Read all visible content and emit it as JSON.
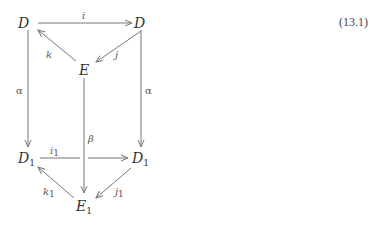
{
  "equation_number": "(13.1)",
  "nodes": {
    "D_top_left": {
      "label": "D",
      "sub": ""
    },
    "D_top_right": {
      "label": "D",
      "sub": ""
    },
    "E": {
      "label": "E",
      "sub": ""
    },
    "D1_left": {
      "label": "D",
      "sub": "1"
    },
    "D1_right": {
      "label": "D",
      "sub": "1"
    },
    "E1": {
      "label": "E",
      "sub": "1"
    }
  },
  "edges": {
    "i": {
      "label": "i",
      "sub": "",
      "from": "D_top_left",
      "to": "D_top_right"
    },
    "j": {
      "label": "j",
      "sub": "",
      "from": "D_top_right",
      "to": "E"
    },
    "k": {
      "label": "k",
      "sub": "",
      "from": "E",
      "to": "D_top_left"
    },
    "alpha_left": {
      "label": "α",
      "from": "D_top_left",
      "to": "D1_left"
    },
    "alpha_right": {
      "label": "α",
      "from": "D_top_right",
      "to": "D1_right"
    },
    "beta": {
      "label": "β",
      "from": "E",
      "to": "E1"
    },
    "i1": {
      "label": "i",
      "sub": "1",
      "from": "D1_left",
      "to": "D1_right"
    },
    "j1": {
      "label": "j",
      "sub": "1",
      "from": "D1_right",
      "to": "E1"
    },
    "k1": {
      "label": "k",
      "sub": "1",
      "from": "E1",
      "to": "D1_left"
    }
  }
}
